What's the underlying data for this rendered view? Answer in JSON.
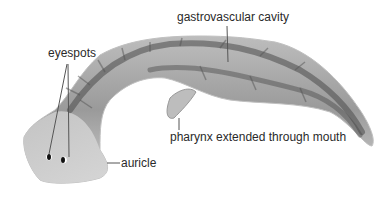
{
  "diagram": {
    "labels": {
      "gastrovascular_cavity": "gastrovascular cavity",
      "eyespots": "eyespots",
      "pharynx": "pharynx extended through mouth",
      "auricle": "auricle"
    },
    "colors": {
      "body_light": "#d8d8d8",
      "body_mid": "#a8a8a8",
      "body_dark": "#4a4a4a",
      "leader": "#555555",
      "text": "#2a2a2a"
    }
  }
}
